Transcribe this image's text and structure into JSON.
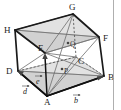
{
  "figure": {
    "background_color": "#ffffff",
    "line_color": "#1a1a1a",
    "shade_color": "#b9b9b9",
    "hidden_line_color": "#4a4a4a"
  },
  "vertices": [
    {
      "id": "A",
      "label": "A",
      "x": 47,
      "y": 96,
      "label_x": 44,
      "label_y": 105,
      "hidden": false
    },
    {
      "id": "B",
      "label": "B",
      "x": 104,
      "y": 76,
      "label_x": 108,
      "label_y": 80,
      "hidden": false
    },
    {
      "id": "C",
      "label": "C",
      "x": 76,
      "y": 57,
      "label_x": 78,
      "label_y": 64,
      "hidden": true
    },
    {
      "id": "D",
      "label": "D",
      "x": 18,
      "y": 71,
      "label_x": 7,
      "label_y": 74,
      "hidden": false
    },
    {
      "id": "E",
      "label": "E",
      "x": 45,
      "y": 53,
      "label_x": 39,
      "label_y": 51,
      "hidden": false
    },
    {
      "id": "F",
      "label": "F",
      "x": 99,
      "y": 37,
      "label_x": 103,
      "label_y": 41,
      "hidden": false
    },
    {
      "id": "G",
      "label": "G",
      "x": 73,
      "y": 14,
      "label_x": 70,
      "label_y": 10,
      "hidden": false
    },
    {
      "id": "H",
      "label": "H",
      "x": 15,
      "y": 30,
      "label_x": 5,
      "label_y": 32,
      "hidden": false
    }
  ],
  "interior_points": [
    {
      "id": "P",
      "label": "P",
      "x": 62,
      "y": 69,
      "label_x": 65,
      "label_y": 73
    },
    {
      "id": "Q",
      "label": "Q",
      "x": 68,
      "y": 43,
      "label_x": 71,
      "label_y": 46
    }
  ],
  "vectors": [
    {
      "id": "b",
      "label": "b",
      "from": "A",
      "to": "B",
      "label_x": 75,
      "label_y": 101,
      "accent": "arrow"
    },
    {
      "id": "d",
      "label": "d",
      "from": "A",
      "to": "D",
      "label_x": 24,
      "label_y": 92,
      "accent": "arrow"
    },
    {
      "id": "e",
      "label": "e",
      "from": "A",
      "to": "E",
      "label_x": 37,
      "label_y": 82,
      "accent": "arrow"
    }
  ],
  "edges_solid": [
    [
      "A",
      "B"
    ],
    [
      "A",
      "D"
    ],
    [
      "D",
      "H"
    ],
    [
      "H",
      "G"
    ],
    [
      "G",
      "F"
    ],
    [
      "F",
      "B"
    ],
    [
      "H",
      "E"
    ],
    [
      "E",
      "A"
    ]
  ],
  "edges_hidden": [
    [
      "D",
      "C"
    ],
    [
      "C",
      "B"
    ],
    [
      "C",
      "G"
    ]
  ],
  "edges_thin": [
    [
      "E",
      "F"
    ],
    [
      "E",
      "G"
    ],
    [
      "H",
      "F"
    ],
    [
      "A",
      "G"
    ],
    [
      "A",
      "F"
    ],
    [
      "D",
      "B"
    ],
    [
      "E",
      "B"
    ],
    [
      "E",
      "C"
    ],
    [
      "A",
      "C"
    ]
  ],
  "shaded_planes": [
    {
      "id": "plane-upper",
      "points": [
        "H",
        "G",
        "F",
        "E"
      ],
      "note": "upper shaded quadrilateral containing Q"
    },
    {
      "id": "plane-lower",
      "points": [
        "D",
        "C",
        "B",
        "A"
      ],
      "note": "lower shaded quadrilateral containing P"
    }
  ],
  "right_rule": {
    "x": 113,
    "from_y": 0,
    "to_y": 110
  }
}
